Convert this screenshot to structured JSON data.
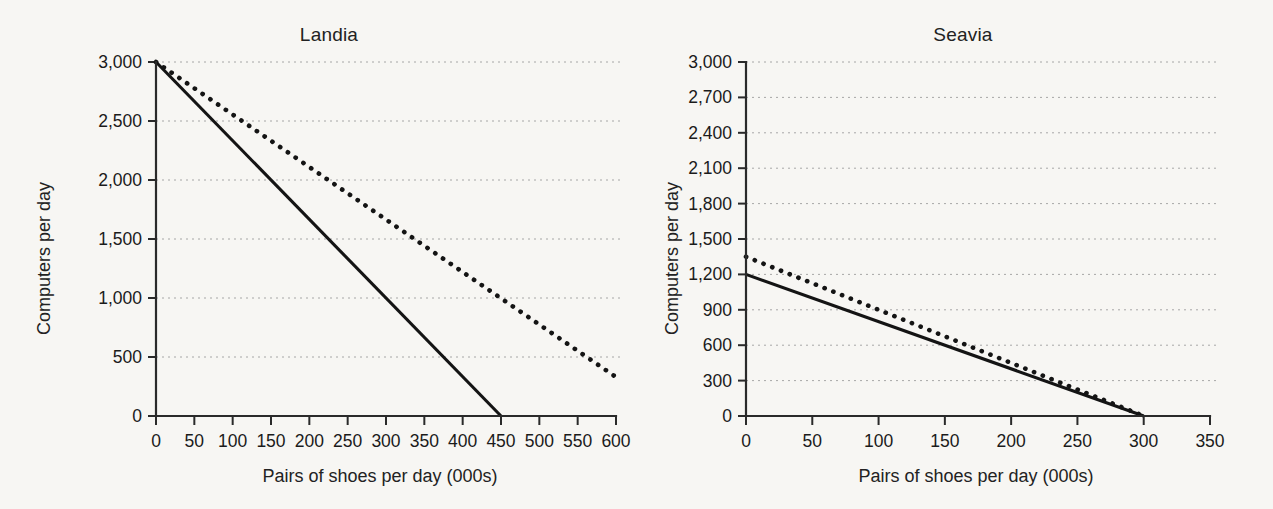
{
  "figure": {
    "background_color": "#f7f6f3",
    "ink_color": "#141414",
    "grid_color": "#9a9a9a"
  },
  "chart_data": [
    {
      "type": "line",
      "title": "Landia",
      "xlabel": "Pairs of shoes per day (000s)",
      "ylabel": "Computers per day",
      "xlim": [
        0,
        600
      ],
      "ylim": [
        0,
        3000
      ],
      "xticks": [
        0,
        50,
        100,
        150,
        200,
        250,
        300,
        350,
        400,
        450,
        500,
        550,
        600
      ],
      "xticklabels": [
        "0",
        "50",
        "100",
        "150",
        "200",
        "250",
        "300",
        "350",
        "400",
        "450",
        "500",
        "550",
        "600"
      ],
      "yticks": [
        0,
        500,
        1000,
        1500,
        2000,
        2500,
        3000
      ],
      "yticklabels": [
        "0",
        "500",
        "1,000",
        "1,500",
        "2,000",
        "2,500",
        "3,000"
      ],
      "grid": "horizontal-dotted",
      "legend": "none",
      "series": [
        {
          "name": "Original PPF",
          "style": "solid",
          "x": [
            0,
            450
          ],
          "y": [
            3000,
            0
          ]
        },
        {
          "name": "New PPF",
          "style": "dotted",
          "x": [
            0,
            600
          ],
          "y": [
            3000,
            330
          ]
        }
      ]
    },
    {
      "type": "line",
      "title": "Seavia",
      "xlabel": "Pairs of shoes per day (000s)",
      "ylabel": "Computers per day",
      "xlim": [
        0,
        350
      ],
      "ylim": [
        0,
        3000
      ],
      "xticks": [
        0,
        50,
        100,
        150,
        200,
        250,
        300,
        350
      ],
      "xticklabels": [
        "0",
        "50",
        "100",
        "150",
        "200",
        "250",
        "300",
        "350"
      ],
      "yticks": [
        0,
        300,
        600,
        900,
        1200,
        1500,
        1800,
        2100,
        2400,
        2700,
        3000
      ],
      "yticklabels": [
        "0",
        "300",
        "600",
        "900",
        "1,200",
        "1,500",
        "1,800",
        "2,100",
        "2,400",
        "2,700",
        "3,000"
      ],
      "grid": "horizontal-dotted",
      "legend": "none",
      "series": [
        {
          "name": "Original PPF",
          "style": "solid",
          "x": [
            0,
            300
          ],
          "y": [
            1200,
            0
          ]
        },
        {
          "name": "New PPF",
          "style": "dotted",
          "x": [
            0,
            300
          ],
          "y": [
            1350,
            0
          ]
        }
      ]
    }
  ]
}
